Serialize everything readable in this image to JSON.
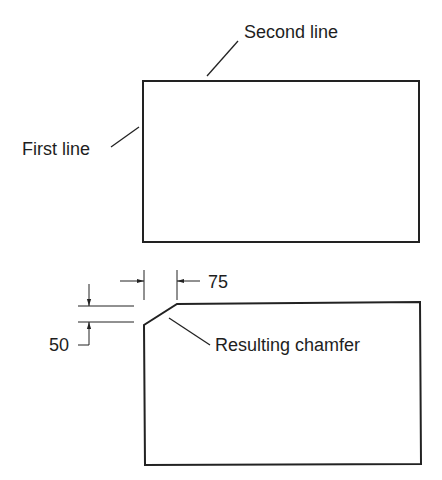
{
  "figure": {
    "type": "technical-drawing",
    "colors": {
      "line": "#222222",
      "text": "#1e1e1e",
      "background": "#ffffff"
    }
  },
  "top_view": {
    "labels": {
      "second_line": "Second line",
      "first_line": "First line"
    }
  },
  "bottom_view": {
    "labels": {
      "horizontal_distance": "75",
      "vertical_distance": "50",
      "result": "Resulting chamfer"
    }
  }
}
